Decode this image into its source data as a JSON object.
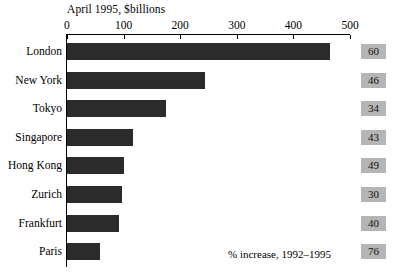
{
  "chart_data": {
    "type": "bar",
    "orientation": "horizontal",
    "title": "April 1995, $billions",
    "xlabel": "",
    "ylabel": "",
    "xlim": [
      0,
      500
    ],
    "grid": false,
    "legend": null,
    "xticks": [
      "0",
      "100",
      "200",
      "300",
      "400",
      "500"
    ],
    "xtick_values": [
      0,
      100,
      200,
      300,
      400,
      500
    ],
    "categories": [
      "London",
      "New York",
      "Tokyo",
      "Singapore",
      "Hong Kong",
      "Zurich",
      "Frankfurt",
      "Paris"
    ],
    "values": [
      464,
      244,
      175,
      116,
      101,
      98,
      91,
      58
    ],
    "annotation": "% increase, 1992–1995",
    "secondary_label": "% increase, 1992–1995",
    "secondary_values": [
      60,
      46,
      34,
      43,
      49,
      30,
      40,
      76
    ],
    "bar_color": "#2b2b2b",
    "value_box_color": "#b5b5b5"
  }
}
